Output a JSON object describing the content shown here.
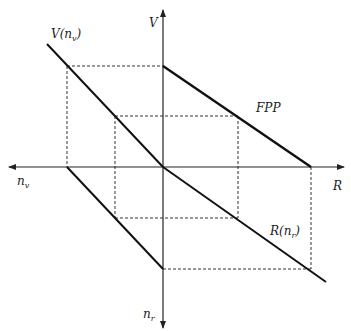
{
  "diagram": {
    "type": "four-quadrant diagram",
    "colors": {
      "line": "#111111",
      "axis": "#222222",
      "dashed": "#333333",
      "background": "#ffffff"
    },
    "axes": {
      "up": {
        "label": "V"
      },
      "right": {
        "label": "R"
      },
      "left": {
        "label": "n",
        "subscript": "v"
      },
      "down": {
        "label": "n",
        "subscript": "r"
      }
    },
    "curves": [
      {
        "id": "fpp",
        "label": "FPP",
        "quadrant": "upper-right"
      },
      {
        "id": "v-nv",
        "label": "V(n",
        "subscript": "v",
        "suffix": ")",
        "quadrant": "upper-left"
      },
      {
        "id": "r-nr",
        "label": "R(n",
        "subscript": "r",
        "suffix": ")",
        "quadrant": "lower-right"
      },
      {
        "id": "nv-nr",
        "label": "",
        "quadrant": "lower-left"
      }
    ],
    "projection_rectangles": [
      "outer",
      "inner"
    ]
  }
}
